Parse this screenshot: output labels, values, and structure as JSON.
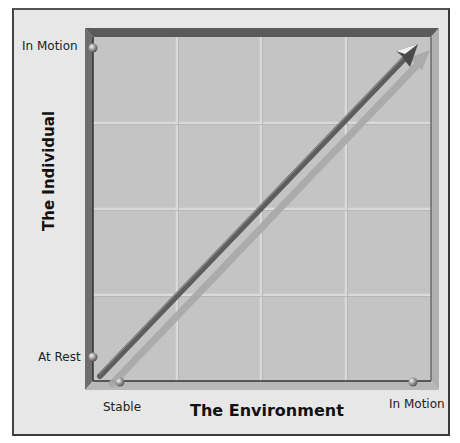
{
  "diagram": {
    "type": "quadrant-grid-with-arrow",
    "x_axis": {
      "title": "The Environment",
      "min_label": "Stable",
      "max_label": "In Motion"
    },
    "y_axis": {
      "title": "The Individual",
      "min_label": "At Rest",
      "max_label": "In Motion"
    },
    "grid": {
      "rows": 4,
      "columns": 4
    },
    "arrow": {
      "from": "At Rest / Stable",
      "to": "In Motion / In Motion",
      "direction": "bottom-left to top-right"
    },
    "colors": {
      "background": "#e7e7e7",
      "plot_fill": "#c4c4c4",
      "grid_line": "#d8d8d8",
      "frame_dark": "#5a5a5a",
      "frame_light": "#a8a8a8",
      "arrow": "#555555",
      "arrow_shadow": "#a9a9a9"
    }
  }
}
